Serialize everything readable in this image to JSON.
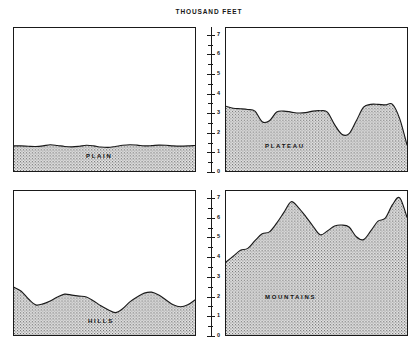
{
  "figure": {
    "title": "THOUSAND FEET",
    "background_color": "#ffffff",
    "ink_color": "#1a1a1a",
    "fill_color": "#d8d8d8"
  },
  "axis": {
    "label": "THOUSAND FEET",
    "ticks": [
      "7",
      "6",
      "5",
      "4",
      "3",
      "2",
      "1",
      "0"
    ],
    "min": 0,
    "max": 7.4
  },
  "panels": {
    "plain": {
      "label": "PLAIN"
    },
    "plateau": {
      "label": "PLATEAU"
    },
    "hills": {
      "label": "HILLS"
    },
    "mountains": {
      "label": "MOUNTAINS"
    }
  },
  "chart_data": [
    {
      "type": "area",
      "title": "PLAIN",
      "subtitle": "",
      "xlabel": "",
      "ylabel": "THOUSAND FEET",
      "ylim": [
        0,
        7.4
      ],
      "yticks": [
        0,
        1,
        2,
        3,
        4,
        5,
        6,
        7
      ],
      "grid": false,
      "legend": "none",
      "x": [
        0,
        4,
        8,
        12,
        16,
        20,
        24,
        28,
        32,
        36,
        40,
        44,
        48,
        52,
        56,
        60,
        64,
        68,
        72,
        76,
        80,
        84,
        88,
        92,
        96,
        100
      ],
      "values": [
        1.3,
        1.3,
        1.28,
        1.27,
        1.3,
        1.36,
        1.32,
        1.27,
        1.25,
        1.28,
        1.33,
        1.3,
        1.24,
        1.22,
        1.27,
        1.33,
        1.36,
        1.34,
        1.3,
        1.31,
        1.34,
        1.33,
        1.3,
        1.29,
        1.3,
        1.32
      ]
    },
    {
      "type": "area",
      "title": "PLATEAU",
      "subtitle": "",
      "xlabel": "",
      "ylabel": "THOUSAND FEET",
      "ylim": [
        0,
        7.4
      ],
      "yticks": [
        0,
        1,
        2,
        3,
        4,
        5,
        6,
        7
      ],
      "grid": false,
      "legend": "none",
      "x": [
        0,
        4,
        8,
        12,
        16,
        20,
        24,
        28,
        32,
        36,
        40,
        44,
        48,
        52,
        56,
        60,
        64,
        68,
        72,
        76,
        80,
        84,
        88,
        92,
        96,
        100
      ],
      "values": [
        3.35,
        3.25,
        3.22,
        3.18,
        3.1,
        2.55,
        2.6,
        3.05,
        3.1,
        3.05,
        3.0,
        3.02,
        3.1,
        3.12,
        3.05,
        2.4,
        1.9,
        1.93,
        2.6,
        3.3,
        3.45,
        3.45,
        3.42,
        3.45,
        2.7,
        1.35
      ]
    },
    {
      "type": "area",
      "title": "HILLS",
      "subtitle": "",
      "xlabel": "",
      "ylabel": "THOUSAND FEET",
      "ylim": [
        0,
        7.4
      ],
      "yticks": [
        0,
        1,
        2,
        3,
        4,
        5,
        6,
        7
      ],
      "grid": false,
      "legend": "none",
      "x": [
        0,
        4,
        8,
        12,
        16,
        20,
        24,
        28,
        32,
        36,
        40,
        44,
        48,
        52,
        56,
        60,
        64,
        68,
        72,
        76,
        80,
        84,
        88,
        92,
        96,
        100
      ],
      "values": [
        2.45,
        2.25,
        1.85,
        1.55,
        1.6,
        1.75,
        1.95,
        2.1,
        2.05,
        2.0,
        1.95,
        1.75,
        1.5,
        1.3,
        1.15,
        1.35,
        1.7,
        1.95,
        2.15,
        2.2,
        2.05,
        1.8,
        1.55,
        1.45,
        1.55,
        1.8
      ]
    },
    {
      "type": "area",
      "title": "MOUNTAINS",
      "subtitle": "",
      "xlabel": "",
      "ylabel": "THOUSAND FEET",
      "ylim": [
        0,
        7.4
      ],
      "yticks": [
        0,
        1,
        2,
        3,
        4,
        5,
        6,
        7
      ],
      "grid": false,
      "legend": "none",
      "x": [
        0,
        4,
        8,
        12,
        16,
        20,
        24,
        28,
        32,
        36,
        40,
        44,
        48,
        52,
        56,
        60,
        64,
        68,
        72,
        76,
        80,
        84,
        88,
        92,
        96,
        100
      ],
      "values": [
        3.75,
        4.05,
        4.35,
        4.45,
        4.85,
        5.2,
        5.3,
        5.75,
        6.3,
        6.85,
        6.55,
        6.1,
        5.6,
        5.15,
        5.35,
        5.6,
        5.65,
        5.55,
        5.05,
        4.9,
        5.35,
        5.85,
        6.0,
        6.7,
        7.05,
        6.05
      ]
    }
  ]
}
